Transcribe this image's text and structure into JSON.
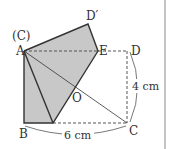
{
  "diagram": {
    "type": "folded-rectangle-geometry",
    "colors": {
      "fill": "#c8c8c8",
      "stroke": "#333333",
      "dashed": "#555555",
      "border": "#888888"
    },
    "labels": {
      "c_paren": "(C)",
      "a": "A",
      "b": "B",
      "c": "C",
      "d": "D",
      "d_prime": "D′",
      "e": "E",
      "o": "O",
      "width": "6 cm",
      "height": "4 cm"
    },
    "points": {
      "A": [
        24,
        51
      ],
      "B": [
        24,
        123
      ],
      "C": [
        127,
        123
      ],
      "D": [
        127,
        51
      ],
      "E": [
        98,
        51
      ],
      "D_prime": [
        88,
        24
      ],
      "F": [
        53,
        123
      ],
      "O": [
        77,
        88
      ]
    }
  }
}
